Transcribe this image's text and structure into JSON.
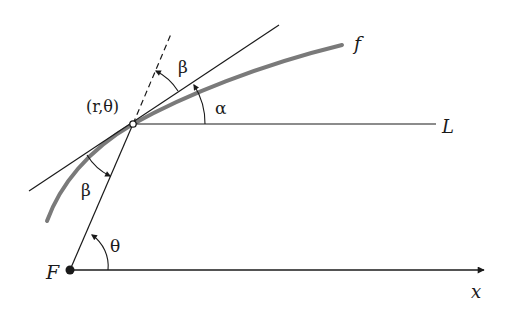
{
  "figure": {
    "type": "geometry-diagram",
    "colors": {
      "line": "#1a1a1a",
      "curve": "#7a7a7a",
      "background": "#ffffff"
    },
    "labels": {
      "curve": "f",
      "point": "(r,θ)",
      "horizontal_line": "L",
      "axis": "x",
      "focus": "F",
      "angle_alpha": "α",
      "angle_beta_top": "β",
      "angle_beta_bottom": "β",
      "angle_theta": "θ"
    },
    "elements": {
      "focus_point": "F (origin)",
      "polar_axis": "x-axis with arrow",
      "radial_line": "line from F through (r,θ), dashed extension",
      "tangent_line": "tangent to f at (r,θ)",
      "reference_line": "L parallel to x-axis through (r,θ)"
    }
  }
}
